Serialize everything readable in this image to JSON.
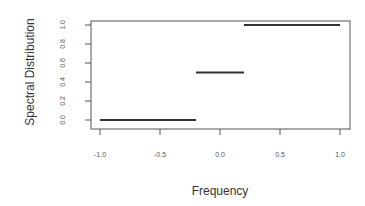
{
  "chart_data": {
    "type": "line",
    "title": "",
    "xlabel": "Frequency",
    "ylabel": "Spectral Distribution",
    "xlim": [
      -1.0,
      1.0
    ],
    "ylim": [
      0.0,
      1.0
    ],
    "x_ticks": [
      "-1.0",
      "-0.5",
      "0.0",
      "0.5",
      "1.0"
    ],
    "y_ticks": [
      "0.0",
      "0.2",
      "0.4",
      "0.6",
      "0.8",
      "1.0"
    ],
    "grid": false,
    "legend": null,
    "series": [
      {
        "name": "step segments",
        "segments": [
          {
            "x0": -1.0,
            "x1": -0.2,
            "y": 0.0
          },
          {
            "x0": -0.2,
            "x1": 0.2,
            "y": 0.5
          },
          {
            "x0": 0.2,
            "x1": 1.0,
            "y": 1.0
          }
        ]
      }
    ]
  },
  "colors": {
    "line": "#333333",
    "axis": "#555555",
    "background": "#ffffff"
  }
}
